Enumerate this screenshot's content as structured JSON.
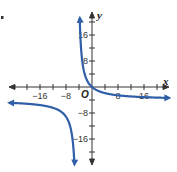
{
  "problem_marker": ".",
  "chart_data": {
    "type": "line",
    "title": "",
    "xlabel": "x",
    "ylabel": "y",
    "origin_label": "O",
    "xlim": [
      -26,
      24
    ],
    "ylim": [
      -24,
      24
    ],
    "grid": false,
    "x_tick_step": 4,
    "y_tick_step": 4,
    "x_tick_labels": [
      {
        "value": -16,
        "text": "−16"
      },
      {
        "value": -8,
        "text": "−8"
      },
      {
        "value": 8,
        "text": "8"
      },
      {
        "value": 16,
        "text": "16"
      }
    ],
    "y_tick_labels": [
      {
        "value": 16,
        "text": "16"
      },
      {
        "value": 8,
        "text": "8"
      },
      {
        "value": -8,
        "text": "−8"
      },
      {
        "value": -16,
        "text": "−16"
      }
    ],
    "function": "y = 18/(x + 4.5) - 4 (estimated)",
    "asymptotes": {
      "vertical_x": -4.5,
      "horizontal_y": -4
    },
    "series": [
      {
        "name": "right branch",
        "color": "#2f5fa8",
        "points": [
          [
            -3.83,
            23
          ],
          [
            -3.5,
            14
          ],
          [
            -3,
            8
          ],
          [
            -2,
            2.77
          ],
          [
            -1,
            1.14
          ],
          [
            0,
            0
          ],
          [
            2,
            -1.23
          ],
          [
            4,
            -1.88
          ],
          [
            8,
            -2.56
          ],
          [
            12,
            -2.91
          ],
          [
            16,
            -3.12
          ],
          [
            20,
            -3.27
          ],
          [
            23,
            -3.35
          ]
        ]
      },
      {
        "name": "left branch",
        "color": "#2f5fa8",
        "points": [
          [
            -25,
            -4.88
          ],
          [
            -20,
            -5.16
          ],
          [
            -16,
            -5.55
          ],
          [
            -12,
            -6.4
          ],
          [
            -10,
            -7.27
          ],
          [
            -8,
            -9.14
          ],
          [
            -7,
            -11.2
          ],
          [
            -6,
            -16
          ],
          [
            -5.5,
            -22
          ],
          [
            -5.4,
            -24
          ]
        ]
      }
    ]
  }
}
